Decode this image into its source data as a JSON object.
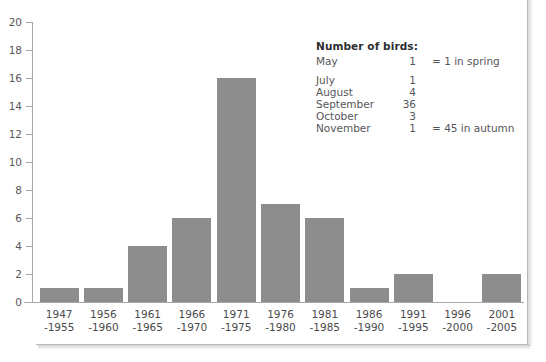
{
  "page": {
    "clipped_top_text": "",
    "background_color": "#ffffff",
    "bar_color": "#8d8d8d",
    "axis_color": "#a8a8a8"
  },
  "legend": {
    "title": "Number of birds:",
    "rows": [
      {
        "month": "May",
        "count": "1",
        "note": "= 1 in spring"
      },
      {
        "month": "July",
        "count": "1",
        "note": ""
      },
      {
        "month": "August",
        "count": "4",
        "note": ""
      },
      {
        "month": "September",
        "count": "36",
        "note": ""
      },
      {
        "month": "October",
        "count": "3",
        "note": ""
      },
      {
        "month": "November",
        "count": "1",
        "note": "= 45 in autumn"
      }
    ]
  },
  "chart_data": {
    "type": "bar",
    "title": "",
    "xlabel": "",
    "ylabel": "",
    "ylim": [
      0,
      20
    ],
    "y_ticks": [
      "0",
      "2",
      "4",
      "6",
      "8",
      "10",
      "12",
      "14",
      "16",
      "18",
      "20"
    ],
    "grid": false,
    "legend_position": "inside-top-right",
    "categories": [
      "1947\n-1955",
      "1956\n-1960",
      "1961\n-1965",
      "1966\n-1970",
      "1971\n-1975",
      "1976\n-1980",
      "1981\n-1985",
      "1986\n-1990",
      "1991\n-1995",
      "1996\n-2000",
      "2001\n-2005"
    ],
    "values": [
      1,
      1,
      4,
      6,
      16,
      7,
      6,
      1,
      2,
      0,
      2
    ]
  }
}
